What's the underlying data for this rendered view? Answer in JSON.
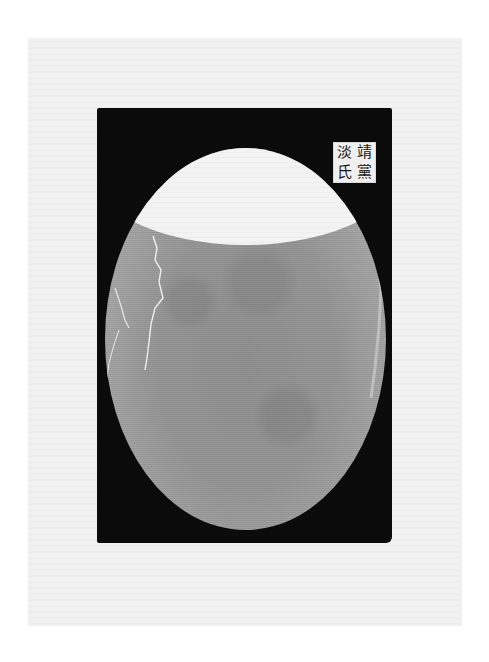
{
  "page": {
    "colors": {
      "page_bg": "#ffffff",
      "sheet": "#f1f1f1",
      "mount": "#0b0b0b",
      "rubbing": "#939393",
      "blank_area": "#f3f3f3",
      "seal_bg": "#f0f0f0",
      "seal_ink": "#1a1a1a"
    }
  },
  "rubbing": {
    "shape": "oval",
    "features": [
      "blank-upper-crescent",
      "cracks-left",
      "worn-bottom-edge"
    ]
  },
  "seal": {
    "style": "square intaglio seal, 4 characters, 2 columns read right-to-left",
    "chars": [
      "靖",
      "黨",
      "淡",
      "氏"
    ]
  }
}
